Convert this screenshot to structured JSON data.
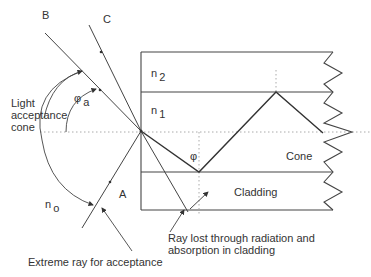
{
  "diagram": {
    "rays": {
      "b_label": "B",
      "c_label": "C",
      "a_label": "A"
    },
    "media": {
      "n2_base": "n",
      "n2_sub": "2",
      "n1_base": "n",
      "n1_sub": "1",
      "n0_base": "n",
      "n0_sub": "o"
    },
    "angles": {
      "acceptance_symbol": "φ",
      "acceptance_sub": "a",
      "internal_symbol": "φ"
    },
    "labels": {
      "light_acceptance_line1": "Light",
      "light_acceptance_line2": "acceptance",
      "light_acceptance_line3": "cone",
      "core": "Cone",
      "cladding": "Cladding",
      "ray_lost_line1": "Ray lost through radiation and",
      "ray_lost_line2": "absorption in cladding",
      "extreme_ray": "Extreme ray for acceptance"
    },
    "colors": {
      "line": "#444444",
      "dotted": "#aaaaaa",
      "text": "#333333"
    }
  }
}
